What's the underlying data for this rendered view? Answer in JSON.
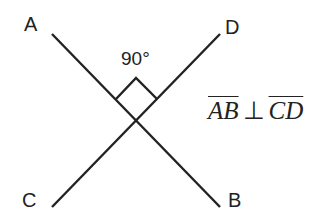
{
  "diagram": {
    "points": {
      "A": "A",
      "B": "B",
      "C": "C",
      "D": "D"
    },
    "angle_label": "90°",
    "relation": {
      "left": "AB",
      "symbol": "⊥",
      "right": "CD"
    },
    "colors": {
      "stroke": "#222222",
      "background": "#ffffff"
    }
  }
}
